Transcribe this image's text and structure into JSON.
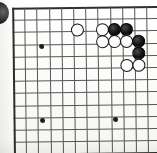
{
  "diagram": {
    "board_style": "printed-scan",
    "colors": {
      "paper": "#fdfdfb",
      "grid_line": "#565656",
      "border_line": "#2e2e2e",
      "black_stone": "#141414",
      "white_stone": "#ffffff",
      "white_stone_outline": "#1a1a1a",
      "hoshi": "#1d1d1d"
    },
    "grid": {
      "origin_x": 13,
      "origin_y": 7,
      "spacing": 12.2,
      "columns": 12,
      "rows": 12,
      "visible_border_edges": [
        "top",
        "left",
        "right",
        "bottom"
      ]
    },
    "hoshi_points": [
      {
        "name": "hoshi-upper-left",
        "x": 42,
        "y": 46
      },
      {
        "name": "hoshi-lower-left",
        "x": 42,
        "y": 120
      },
      {
        "name": "hoshi-lower-center",
        "x": 115,
        "y": 120
      }
    ],
    "stones": [
      {
        "name": "white-approach-stone",
        "color": "white",
        "x": 78,
        "y": 30
      },
      {
        "name": "white-stone-r1c1",
        "color": "white",
        "x": 103,
        "y": 30
      },
      {
        "name": "black-stone-r1c2",
        "color": "black",
        "x": 115,
        "y": 30
      },
      {
        "name": "black-stone-r1c3",
        "color": "black",
        "x": 127,
        "y": 30
      },
      {
        "name": "white-stone-r2c1",
        "color": "white",
        "x": 103,
        "y": 42
      },
      {
        "name": "white-stone-r2c2",
        "color": "white",
        "x": 115,
        "y": 42
      },
      {
        "name": "white-stone-r2c3",
        "color": "white",
        "x": 127,
        "y": 42
      },
      {
        "name": "black-stone-r2c4",
        "color": "black",
        "x": 139,
        "y": 42
      },
      {
        "name": "black-stone-r3c4",
        "color": "black",
        "x": 139,
        "y": 54
      },
      {
        "name": "white-stone-r4c3",
        "color": "white",
        "x": 127,
        "y": 66
      },
      {
        "name": "white-stone-r4c4",
        "color": "white",
        "x": 139,
        "y": 66
      }
    ],
    "edge_marker": {
      "name": "clipped-circle-marker",
      "description": "dark circle clipped by the left page edge"
    },
    "counts": {
      "black_stones": "4",
      "white_stones": "7",
      "total_stones": "11"
    }
  }
}
